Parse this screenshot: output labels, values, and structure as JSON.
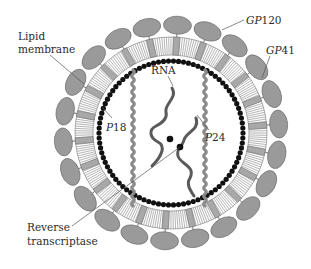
{
  "diagram": {
    "labels": {
      "lipid_membrane_line1": "Lipid",
      "lipid_membrane_line2": "membrane",
      "gp120_prefix": "GP",
      "gp120_num": "120",
      "gp41_prefix": "GP",
      "gp41_num": "41",
      "rna": "RNA",
      "p18_prefix": "P",
      "p18_num": "18",
      "p24_prefix": "P",
      "p24_num": "24",
      "rt_line1": "Reverse",
      "rt_line2": "transcriptase"
    },
    "geometry": {
      "center": [
        171,
        133
      ],
      "glycoprotein_count": 22,
      "glycoprotein_radius": 108,
      "membrane_inner_radius": 78,
      "membrane_outer_radius": 96,
      "matrix_dot_ring_radius": 72,
      "matrix_dot_count": 90
    },
    "colors": {
      "glycoprotein_fill": "#9a9a9a",
      "glycoprotein_stroke": "#6e6e6e",
      "membrane_block": "#a8a8a8",
      "membrane_stripe": "#777777",
      "matrix_dots": "#111111",
      "capsid_wave": "#8a8a8a",
      "rna_strand": "#5a5a5a",
      "text": "#2a2a2a"
    }
  }
}
